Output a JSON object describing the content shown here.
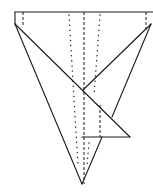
{
  "diagram": {
    "type": "fold-diagram",
    "stroke_color": "#1a1a1a",
    "background": "#ffffff",
    "solid_lines": [
      {
        "name": "top-edge",
        "points": [
          [
            15,
            12
          ],
          [
            153,
            12
          ]
        ]
      },
      {
        "name": "left-corner-edge",
        "points": [
          [
            15,
            12
          ],
          [
            15,
            24
          ]
        ]
      },
      {
        "name": "left-outer-edge",
        "points": [
          [
            15,
            24
          ],
          [
            82,
            184
          ]
        ]
      },
      {
        "name": "long-diagonal",
        "points": [
          [
            15,
            24
          ],
          [
            130,
            137
          ]
        ]
      },
      {
        "name": "right-upper-diagonal",
        "points": [
          [
            151,
            24
          ],
          [
            83,
            90
          ]
        ]
      },
      {
        "name": "right-outer-edge",
        "points": [
          [
            151,
            24
          ],
          [
            112,
            117
          ]
        ]
      },
      {
        "name": "flap-bottom-edge",
        "points": [
          [
            82,
            137
          ],
          [
            130,
            137
          ]
        ]
      },
      {
        "name": "lower-flap-edge",
        "points": [
          [
            102,
            137
          ],
          [
            82,
            184
          ]
        ]
      }
    ],
    "dashed_lines": [
      {
        "name": "center-crease",
        "points": [
          [
            84,
            12
          ],
          [
            84,
            184
          ]
        ]
      },
      {
        "name": "left-corner-crease",
        "points": [
          [
            23,
            12
          ],
          [
            23,
            25
          ]
        ]
      },
      {
        "name": "right-corner-crease",
        "points": [
          [
            146,
            12
          ],
          [
            146,
            30
          ]
        ]
      },
      {
        "name": "flap-crease",
        "points": [
          [
            100,
            105
          ],
          [
            100,
            137
          ]
        ]
      }
    ],
    "dotted_lines": [
      {
        "name": "left-dotted-fold",
        "points": [
          [
            69,
            15
          ],
          [
            78,
            165
          ]
        ]
      },
      {
        "name": "right-dotted-fold-upper",
        "points": [
          [
            100,
            15
          ],
          [
            94,
            96
          ]
        ]
      },
      {
        "name": "lower-dotted-fold",
        "points": [
          [
            89,
            143
          ],
          [
            87,
            165
          ]
        ]
      }
    ]
  }
}
